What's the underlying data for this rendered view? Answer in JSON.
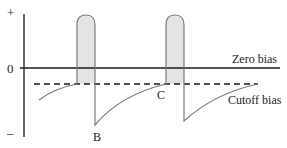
{
  "diagram": {
    "type": "grid-bias waveform (class C amplifier)",
    "axis_labels": {
      "plus": "+",
      "zero": "0",
      "minus": "–"
    },
    "lines": {
      "zero_bias": "Zero bias",
      "cutoff_bias": "Cutoff bias"
    },
    "points": {
      "B": "B",
      "C": "C"
    },
    "colors": {
      "axis": "#1a1a1a",
      "waveform": "#7a7a7a",
      "pulse_fill": "#e4e4e4",
      "dashed": "#1a1a1a",
      "text": "#222222"
    }
  }
}
